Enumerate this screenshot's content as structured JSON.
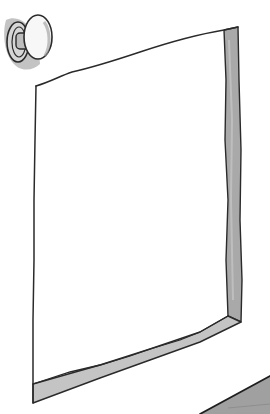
{
  "illustration": {
    "description": "Hand-drawn grayscale sketch of an empty rectangular frame or open panel viewed in perspective, with a round knob in the upper-left corner",
    "style": "ink sketch with gray wash",
    "colors": {
      "background": "#ffffff",
      "ink": "#2a2a2a",
      "wash_light": "#c8c8c8",
      "wash_mid": "#a9a9a9",
      "wash_dark": "#8e8e8e"
    },
    "elements": [
      {
        "name": "knob",
        "icon": "round-knob-icon"
      },
      {
        "name": "frame",
        "icon": "rectangular-frame-icon"
      },
      {
        "name": "floor-edge",
        "icon": "diagonal-edge-icon"
      }
    ]
  }
}
